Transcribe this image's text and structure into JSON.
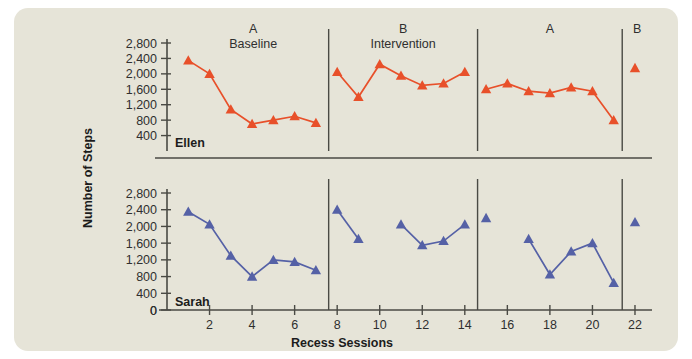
{
  "figure": {
    "background_color": "#e6e4d8",
    "axis_color": "#4a4a44",
    "y_axis_title": "Number of Steps",
    "x_axis_title": "Recess Sessions"
  },
  "chart_data": {
    "type": "line",
    "title": "",
    "xlabel": "Recess Sessions",
    "ylabel": "Number of Steps",
    "xlim": [
      0,
      22.8
    ],
    "ylim": [
      0,
      2900
    ],
    "x_ticks": [
      0,
      2,
      4,
      6,
      8,
      10,
      12,
      14,
      16,
      18,
      20,
      22
    ],
    "x_tick_labels": [
      "0",
      "2",
      "4",
      "6",
      "8",
      "10",
      "12",
      "14",
      "16",
      "18",
      "20",
      "22"
    ],
    "y_ticks": [
      0,
      400,
      800,
      1200,
      1600,
      2000,
      2400,
      2800
    ],
    "y_tick_labels": [
      "0",
      "400",
      "800",
      "1,200",
      "1,600",
      "2,000",
      "2,400",
      "2,800"
    ],
    "grid": false,
    "legend_position": "none",
    "marker": "triangle-up",
    "phases": [
      {
        "letter": "A",
        "name": "Baseline",
        "x_start": 0.5,
        "x_end": 7.6
      },
      {
        "letter": "B",
        "name": "Intervention",
        "x_start": 7.6,
        "x_end": 14.6
      },
      {
        "letter": "A",
        "name": "",
        "x_start": 14.6,
        "x_end": 21.4
      },
      {
        "letter": "B",
        "name": "",
        "x_start": 21.4,
        "x_end": 22.8
      }
    ],
    "phase_divider_x": [
      7.6,
      14.6,
      21.4
    ],
    "panels": [
      {
        "name": "Ellen",
        "label": "Ellen",
        "color": "#e8502a",
        "series": [
          {
            "name": "Ellen A Baseline",
            "phase": "A",
            "x": [
              1,
              2,
              3,
              4,
              5,
              6,
              7
            ],
            "values": [
              2350,
              2000,
              1080,
              700,
              800,
              900,
              730
            ]
          },
          {
            "name": "Ellen B Intervention",
            "phase": "B",
            "x": [
              8,
              9,
              10,
              11,
              12,
              13,
              14
            ],
            "values": [
              2050,
              1400,
              2250,
              1950,
              1700,
              1750,
              2050
            ]
          },
          {
            "name": "Ellen A Return",
            "phase": "A",
            "x": [
              15,
              16,
              17,
              18,
              19,
              20,
              21
            ],
            "values": [
              1600,
              1750,
              1550,
              1500,
              1650,
              1550,
              800
            ]
          },
          {
            "name": "Ellen B Follow-up",
            "phase": "B",
            "x": [
              22
            ],
            "values": [
              2150
            ]
          }
        ]
      },
      {
        "name": "Sarah",
        "label": "Sarah",
        "color": "#5561a6",
        "series": [
          {
            "name": "Sarah A Baseline",
            "phase": "A",
            "x": [
              1,
              2,
              3,
              4,
              5,
              6,
              7
            ],
            "values": [
              2350,
              2050,
              1300,
              800,
              1200,
              1150,
              950
            ]
          },
          {
            "name": "Sarah B Intervention part 1",
            "phase": "B",
            "x": [
              8,
              9
            ],
            "values": [
              2400,
              1700
            ]
          },
          {
            "name": "Sarah B Intervention part 2",
            "phase": "B",
            "x": [
              11,
              12,
              13,
              14
            ],
            "values": [
              2050,
              1550,
              1650,
              2050
            ]
          },
          {
            "name": "Sarah A Return point",
            "phase": "A",
            "x": [
              15
            ],
            "values": [
              2200
            ]
          },
          {
            "name": "Sarah A Return",
            "phase": "A",
            "x": [
              17,
              18,
              19,
              20,
              21
            ],
            "values": [
              1700,
              850,
              1400,
              1600,
              650
            ]
          },
          {
            "name": "Sarah B Follow-up",
            "phase": "B",
            "x": [
              22
            ],
            "values": [
              2100
            ]
          }
        ]
      }
    ]
  }
}
